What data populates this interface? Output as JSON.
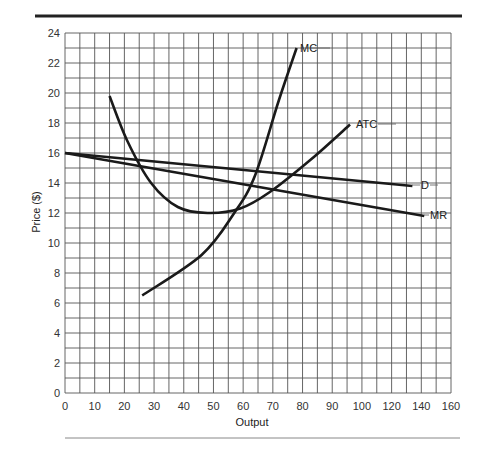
{
  "chart_data": {
    "type": "line",
    "title": "",
    "xlabel": "Output",
    "ylabel": "Price ($)",
    "x_tick_labels": [
      "0",
      "10",
      "20",
      "30",
      "40",
      "50",
      "60",
      "70",
      "80",
      "90",
      "100",
      "120",
      "140",
      "160"
    ],
    "y_tick_labels": [
      "0",
      "2",
      "4",
      "6",
      "8",
      "10",
      "12",
      "14",
      "16",
      "18",
      "20",
      "22",
      "24"
    ],
    "ylim": [
      0,
      24
    ],
    "grid": true,
    "grid_minor": true,
    "legend": "inline labels at curve ends",
    "series": [
      {
        "name": "MC",
        "points": [
          [
            26,
            6.5
          ],
          [
            46,
            9.2
          ],
          [
            57,
            12.0
          ],
          [
            64,
            14.5
          ],
          [
            72,
            19.5
          ],
          [
            78,
            23.0
          ]
        ]
      },
      {
        "name": "ATC",
        "points": [
          [
            15,
            19.8
          ],
          [
            21,
            16.8
          ],
          [
            29,
            14.0
          ],
          [
            38,
            12.4
          ],
          [
            48,
            12.0
          ],
          [
            59,
            12.3
          ],
          [
            69,
            13.4
          ],
          [
            83,
            15.6
          ],
          [
            96,
            17.9
          ]
        ]
      },
      {
        "name": "D",
        "points": [
          [
            0,
            16.0
          ],
          [
            117,
            13.8
          ]
        ]
      },
      {
        "name": "MR",
        "points": [
          [
            0,
            16.0
          ],
          [
            121,
            11.8
          ]
        ]
      }
    ],
    "labels": {
      "mc": "MC",
      "atc": "ATC",
      "d": "D",
      "mr": "MR"
    }
  }
}
